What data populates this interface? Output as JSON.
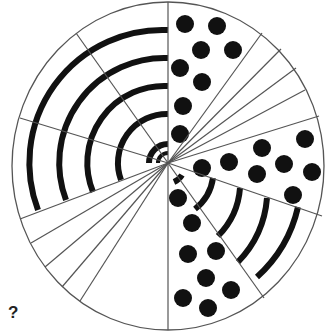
{
  "puzzle": {
    "type": "circle-sector-pattern-puzzle",
    "question_mark": "?",
    "colors": {
      "background": "#ffffff",
      "stroke": "#555555",
      "fill": "#111111"
    },
    "circle": {
      "cx": 168,
      "cy": 166,
      "rx": 156,
      "ry": 164
    },
    "sectors": [
      {
        "name": "upper-left-arcs",
        "pattern": "concentric-arcs",
        "arc_count": 6
      },
      {
        "name": "upper-right-dots",
        "pattern": "dots",
        "dot_count": 8
      },
      {
        "name": "upper-right-fan",
        "pattern": "fan-lines",
        "line_count": 5
      },
      {
        "name": "right-dots",
        "pattern": "dots",
        "dot_count": 8
      },
      {
        "name": "lower-right-arcs",
        "pattern": "concentric-arcs",
        "arc_count": 6
      },
      {
        "name": "bottom-dots",
        "pattern": "dots",
        "dot_count": 8
      },
      {
        "name": "lower-left-fan",
        "pattern": "fan-lines",
        "line_count": 5
      },
      {
        "name": "bottom-left-empty",
        "pattern": "missing"
      }
    ]
  }
}
